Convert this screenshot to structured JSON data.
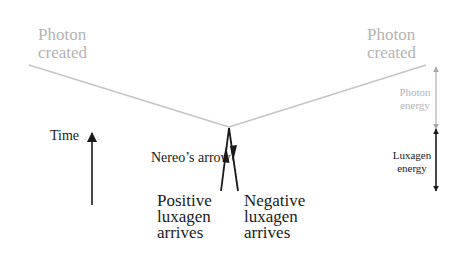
{
  "diagram": {
    "colors": {
      "photon": "#b8b8b8",
      "luxagen": "#1a1a1a",
      "background": "#ffffff"
    },
    "labels": {
      "photon_created_left": [
        "Photon",
        "created"
      ],
      "photon_created_right": [
        "Photon",
        "created"
      ],
      "time": "Time",
      "nereos_arrow": "Nereo’s arrow",
      "positive_luxagen": [
        "Positive",
        "luxagen",
        "arrives"
      ],
      "negative_luxagen": [
        "Negative",
        "luxagen",
        "arrives"
      ],
      "photon_energy": [
        "Photon",
        "energy"
      ],
      "luxagen_energy": [
        "Luxagen",
        "energy"
      ]
    },
    "elements": {
      "photon_worldlines": "Two gray photon paths diverging upward from the collision vertex",
      "luxagen_worldlines": "Positive luxagen arrow pointing up into vertex; negative luxagen arrow pointing down out of vertex",
      "time_axis": "Upward-pointing time arrow",
      "energy_scale": "Gray double arrow for photon energy above black double arrow for luxagen energy"
    }
  }
}
